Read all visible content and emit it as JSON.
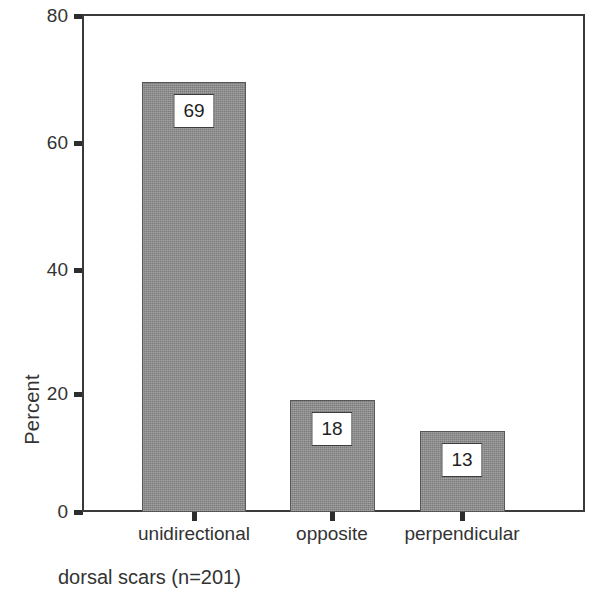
{
  "chart_data": {
    "type": "bar",
    "title": "",
    "subtitle": "",
    "xlabel": "dorsal scars (n=201)",
    "ylabel": "Percent",
    "categories": [
      "unidirectional",
      "opposite",
      "perpendicular"
    ],
    "values": [
      69,
      18,
      13
    ],
    "data_labels": [
      "69",
      "18",
      "13"
    ],
    "ylim": [
      0,
      80
    ],
    "yticks": [
      0,
      20,
      40,
      60,
      80
    ],
    "ytick_labels": [
      "0",
      "20",
      "40",
      "60",
      "80"
    ],
    "grid": false,
    "legend": null,
    "legend_position": "none",
    "bar_color": "#8d8d8d",
    "bar_border_color": "#575757",
    "axis_color": "#3a3a3a",
    "label_box_background": "#ffffff",
    "n": 201
  },
  "caption": {
    "text": "dorsal scars (n=201)"
  }
}
